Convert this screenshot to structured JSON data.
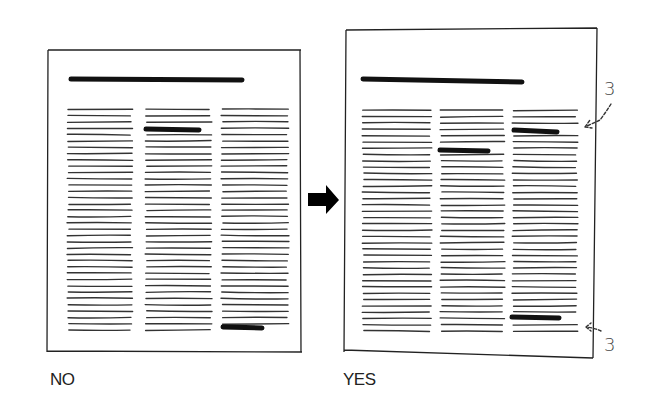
{
  "panels": [
    {
      "label": "NO",
      "description": "Page with headline and three-column text; subheads placed at uneven positions"
    },
    {
      "label": "YES",
      "description": "Page with headline and three-column text; subheads aligned with 3-line spacing to margins"
    }
  ],
  "annotations": {
    "top_spacing": "3",
    "bottom_spacing": "3"
  },
  "arrow": "right-arrow"
}
